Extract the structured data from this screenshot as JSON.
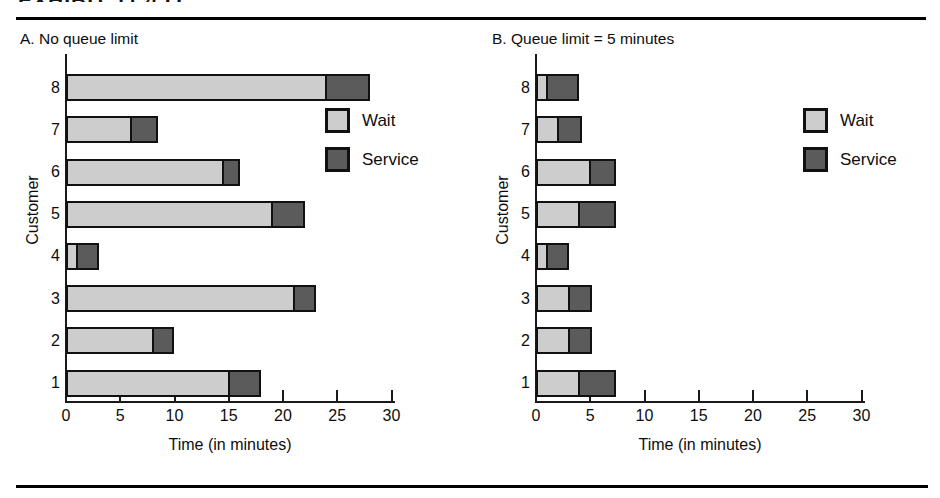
{
  "header": {
    "fragment_text": "EXHIBIT 11.4   Q"
  },
  "legend": {
    "items": [
      {
        "label": "Wait",
        "color": "#cdcdcd",
        "swatch": "wait-swatch"
      },
      {
        "label": "Service",
        "color": "#5b5b5b",
        "swatch": "service-swatch"
      }
    ]
  },
  "axis": {
    "x_title": "Time (in minutes)",
    "y_title": "Customer",
    "x_ticks": [
      0,
      5,
      10,
      15,
      20,
      25,
      30
    ],
    "x_tick_labels": [
      "0",
      "5",
      "10",
      "15",
      "20",
      "25",
      "30"
    ],
    "y_tick_labels": [
      "1",
      "2",
      "3",
      "4",
      "5",
      "6",
      "7",
      "8"
    ]
  },
  "panels": [
    {
      "id": "A",
      "title": "A. No queue limit"
    },
    {
      "id": "B",
      "title": "B. Queue limit = 5 minutes"
    }
  ],
  "chart_data": [
    {
      "type": "bar",
      "orientation": "horizontal",
      "stacked": true,
      "title": "A. No queue limit",
      "xlabel": "Time (in minutes)",
      "ylabel": "Customer",
      "xlim": [
        0,
        31.5
      ],
      "xticks": [
        0,
        5,
        10,
        15,
        20,
        25,
        30
      ],
      "grid": false,
      "legend_position": "inside-right",
      "categories": [
        "1",
        "2",
        "3",
        "4",
        "5",
        "6",
        "7",
        "8"
      ],
      "series": [
        {
          "name": "Wait",
          "color": "#cdcdcd",
          "values": [
            15,
            8,
            21,
            1,
            19,
            14.5,
            6,
            24
          ]
        },
        {
          "name": "Service",
          "color": "#5b5b5b",
          "values": [
            3,
            2,
            2,
            2,
            3,
            1.5,
            2.5,
            4
          ]
        }
      ],
      "totals": [
        18,
        10,
        23,
        3,
        22,
        16,
        8.5,
        28
      ]
    },
    {
      "type": "bar",
      "orientation": "horizontal",
      "stacked": true,
      "title": "B. Queue limit = 5 minutes",
      "xlabel": "Time (in minutes)",
      "ylabel": "Customer",
      "xlim": [
        0,
        31.5
      ],
      "xticks": [
        0,
        5,
        10,
        15,
        20,
        25,
        30
      ],
      "grid": false,
      "legend_position": "inside-right",
      "categories": [
        "1",
        "2",
        "3",
        "4",
        "5",
        "6",
        "7",
        "8"
      ],
      "series": [
        {
          "name": "Wait",
          "color": "#cdcdcd",
          "values": [
            4,
            3,
            3,
            1,
            4,
            5,
            2,
            1
          ]
        },
        {
          "name": "Service",
          "color": "#5b5b5b",
          "values": [
            3.4,
            2.2,
            2.2,
            2,
            3.4,
            2.4,
            2.2,
            3
          ]
        }
      ],
      "totals": [
        7.4,
        5.2,
        5.2,
        3,
        7.4,
        7.4,
        4.2,
        4
      ]
    }
  ]
}
